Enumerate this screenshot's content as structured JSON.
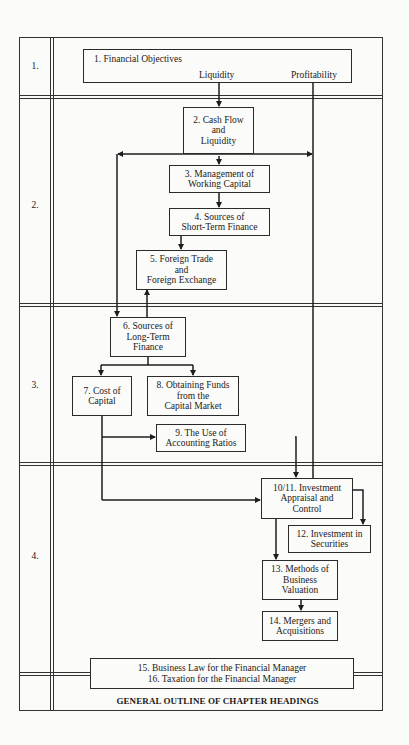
{
  "rows": [
    {
      "label": "1."
    },
    {
      "label": "2."
    },
    {
      "label": "3."
    },
    {
      "label": "4."
    }
  ],
  "boxes": {
    "b1": {
      "title": "1.  Financial Objectives",
      "liquidity": "Liquidity",
      "profitability": "Profitability"
    },
    "b2": {
      "lines": [
        "2.  Cash Flow",
        "and",
        "Liquidity"
      ]
    },
    "b3": {
      "lines": [
        "3.  Management of",
        "Working Capital"
      ]
    },
    "b4": {
      "lines": [
        "4.  Sources of",
        "Short-Term Finance"
      ]
    },
    "b5": {
      "lines": [
        "5.  Foreign Trade",
        "and",
        "Foreign Exchange"
      ]
    },
    "b6": {
      "lines": [
        "6.  Sources of",
        "Long-Term",
        "Finance"
      ]
    },
    "b7": {
      "lines": [
        "7.  Cost of",
        "Capital"
      ]
    },
    "b8": {
      "lines": [
        "8.  Obtaining Funds",
        "from the",
        "Capital Market"
      ]
    },
    "b9": {
      "lines": [
        "9.  The Use of",
        "Accounting Ratios"
      ]
    },
    "b10": {
      "lines": [
        "10/11.  Investment",
        "Appraisal and",
        "Control"
      ]
    },
    "b12": {
      "lines": [
        "12.  Investment in",
        "Securities"
      ]
    },
    "b13": {
      "lines": [
        "13.  Methods of",
        "Business",
        "Valuation"
      ]
    },
    "b14": {
      "lines": [
        "14.  Mergers and",
        "Acquisitions"
      ]
    },
    "b15": {
      "lines": [
        "15.  Business Law for the Financial Manager",
        "16.  Taxation for the Financial Manager"
      ]
    }
  },
  "caption": "GENERAL OUTLINE OF CHAPTER HEADINGS",
  "colors": {
    "line": "#1e1e1e",
    "paper": "#fbfbf9"
  }
}
